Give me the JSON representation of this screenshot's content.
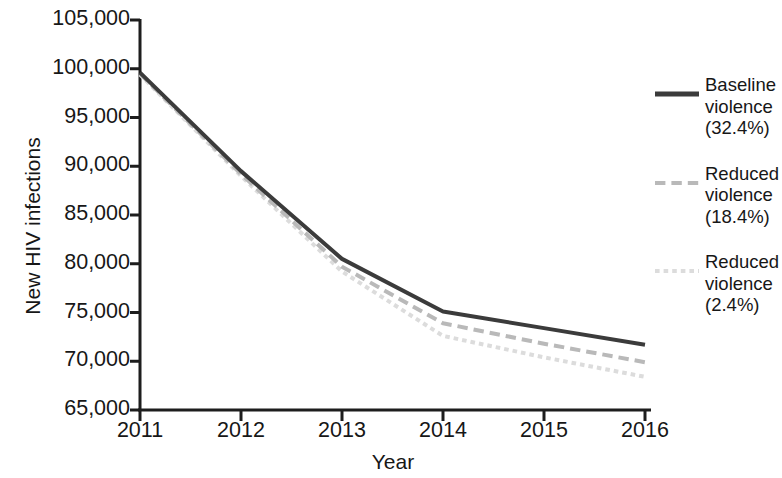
{
  "chart_data": {
    "type": "line",
    "title": "",
    "subtitle": "",
    "xlabel": "Year",
    "ylabel": "New HIV infections",
    "x": [
      2011,
      2012,
      2013,
      2014,
      2015,
      2016
    ],
    "categories": [
      "2011",
      "2012",
      "2013",
      "2014",
      "2015",
      "2016"
    ],
    "xtick_labels": [
      "2011",
      "2012",
      "2013",
      "2014",
      "2015",
      "2016"
    ],
    "ytick_labels": [
      "65,000",
      "70,000",
      "75,000",
      "80,000",
      "85,000",
      "90,000",
      "95,000",
      "100,000",
      "105,000"
    ],
    "ytick_values": [
      65000,
      70000,
      75000,
      80000,
      85000,
      90000,
      95000,
      100000,
      105000
    ],
    "xlim": [
      2011,
      2016
    ],
    "ylim": [
      65000,
      105000
    ],
    "grid": false,
    "legend_position": "right",
    "series": [
      {
        "name": "Baseline violence (32.4%)",
        "label_lines": "Baseline\nviolence\n(32.4%)",
        "style": "solid",
        "color": "#3b3b3b",
        "width": 4,
        "values": [
          99600,
          89500,
          80500,
          75100,
          73400,
          71700
        ]
      },
      {
        "name": "Reduced violence (18.4%)",
        "label_lines": "Reduced\nviolence\n(18.4%)",
        "style": "dashed",
        "color": "#b9b9b9",
        "width": 4,
        "values": [
          99500,
          89200,
          79700,
          73900,
          71800,
          69900
        ]
      },
      {
        "name": "Reduced violence (2.4%)",
        "label_lines": "Reduced\nviolence\n(2.4%)",
        "style": "dotted",
        "color": "#dcdcdc",
        "width": 4,
        "values": [
          99400,
          89000,
          79200,
          72600,
          70400,
          68400
        ]
      }
    ]
  },
  "axes": {
    "y_title": "New HIV infections",
    "x_title": "Year"
  },
  "legend": {
    "entries": [
      {
        "label": "Baseline\nviolence\n(32.4%)"
      },
      {
        "label": "Reduced\nviolence\n(18.4%)"
      },
      {
        "label": "Reduced\nviolence\n(2.4%)"
      }
    ]
  },
  "colors": {
    "background": "#ffffff",
    "axis": "#1d1d1d",
    "text": "#171717",
    "series_baseline": "#3b3b3b",
    "series_reduced_18": "#b9b9b9",
    "series_reduced_2": "#dcdcdc"
  }
}
